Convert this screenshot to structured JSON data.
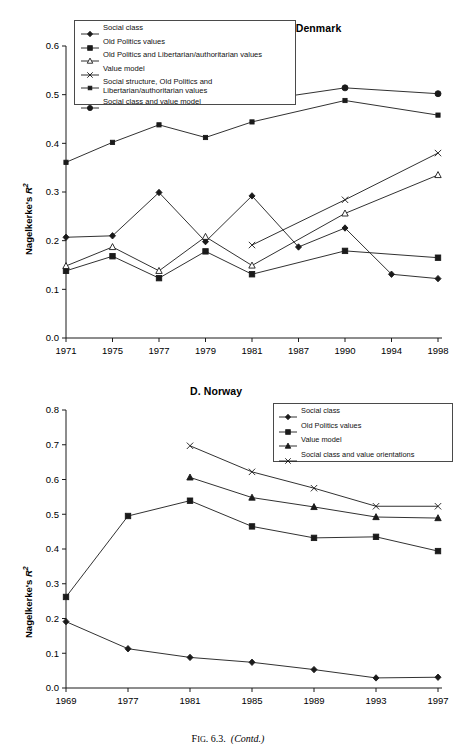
{
  "caption": {
    "fig_prefix": "F",
    "fig_small": "IG",
    "fig_number": ". 6.3.",
    "fig_contd": "(Contd.)"
  },
  "axis_label": {
    "y_text": "Nagelkerke's ",
    "y_italic": "R",
    "y_sup": "2"
  },
  "panels": [
    {
      "id": "denmark",
      "title": "C. Denmark",
      "legend": [
        {
          "label": "Social class",
          "marker": "diamond-filled"
        },
        {
          "label": "Old Politics values",
          "marker": "square-filled"
        },
        {
          "label": "Old Politics and Libertarian/authoritarian values",
          "marker": "triangle-open"
        },
        {
          "label": "Value model",
          "marker": "cross-x"
        },
        {
          "label": "Social structure, Old Politics and Libertarian/authoritarian values",
          "marker": "square-small-filled"
        },
        {
          "label": "Social class and value model",
          "marker": "circle-filled"
        }
      ]
    },
    {
      "id": "norway",
      "title": "D. Norway",
      "legend": [
        {
          "label": "Social class",
          "marker": "diamond-filled"
        },
        {
          "label": "Old Politics values",
          "marker": "square-filled"
        },
        {
          "label": "Value model",
          "marker": "triangle-filled"
        },
        {
          "label": "Social class and value orientations",
          "marker": "cross-x"
        }
      ]
    }
  ],
  "chart_data": [
    {
      "type": "line",
      "title": "C. Denmark",
      "xlabel": "",
      "ylabel": "Nagelkerke's R2",
      "categories": [
        "1971",
        "1975",
        "1977",
        "1979",
        "1981",
        "1987",
        "1990",
        "1994",
        "1998"
      ],
      "ylim": [
        0.0,
        0.6
      ],
      "yticks": [
        "0.0",
        "0.1",
        "0.2",
        "0.3",
        "0.4",
        "0.5",
        "0.6"
      ],
      "grid": false,
      "legend_position": "top-left",
      "series": [
        {
          "name": "Social class",
          "marker": "diamond-filled",
          "x": [
            "1971",
            "1975",
            "1977",
            "1979",
            "1981",
            "1987",
            "1990",
            "1994",
            "1998"
          ],
          "values": [
            0.207,
            0.21,
            0.299,
            0.198,
            0.292,
            0.187,
            0.226,
            0.131,
            0.122
          ]
        },
        {
          "name": "Old Politics values",
          "marker": "square-filled",
          "x": [
            "1971",
            "1975",
            "1977",
            "1979",
            "1981",
            "1987",
            "1990",
            "1994",
            "1998"
          ],
          "values": [
            0.138,
            0.168,
            0.123,
            0.178,
            0.131,
            null,
            0.179,
            null,
            0.165
          ]
        },
        {
          "name": "Old Politics and Libertarian/authoritarian values",
          "marker": "triangle-open",
          "x": [
            "1971",
            "1975",
            "1977",
            "1979",
            "1981",
            "1987",
            "1990",
            "1994",
            "1998"
          ],
          "values": [
            0.148,
            0.187,
            0.138,
            0.208,
            0.149,
            null,
            0.256,
            null,
            0.335
          ]
        },
        {
          "name": "Value model",
          "marker": "cross-x",
          "x": [
            "1981",
            "1990",
            "1998"
          ],
          "values": [
            0.191,
            0.284,
            0.38
          ]
        },
        {
          "name": "Social structure, Old Politics and Libertarian/authoritarian values",
          "marker": "square-small-filled",
          "x": [
            "1971",
            "1975",
            "1977",
            "1979",
            "1981",
            "1987",
            "1990",
            "1998"
          ],
          "values": [
            0.361,
            0.402,
            0.438,
            0.412,
            0.444,
            null,
            0.488,
            0.458
          ]
        },
        {
          "name": "Social class and value model",
          "marker": "circle-filled",
          "x": [
            "1981",
            "1990",
            "1998"
          ],
          "values": [
            0.486,
            0.514,
            0.502
          ]
        }
      ]
    },
    {
      "type": "line",
      "title": "D. Norway",
      "xlabel": "",
      "ylabel": "Nagelkerke's R2",
      "categories": [
        "1969",
        "1977",
        "1981",
        "1985",
        "1989",
        "1993",
        "1997"
      ],
      "ylim": [
        0.0,
        0.8
      ],
      "yticks": [
        "0.0",
        "0.1",
        "0.2",
        "0.3",
        "0.4",
        "0.5",
        "0.6",
        "0.7",
        "0.8"
      ],
      "grid": false,
      "legend_position": "top-right",
      "series": [
        {
          "name": "Social class",
          "marker": "diamond-filled",
          "x": [
            "1969",
            "1977",
            "1981",
            "1985",
            "1989",
            "1993",
            "1997"
          ],
          "values": [
            0.191,
            0.113,
            0.088,
            0.074,
            0.053,
            0.029,
            0.031
          ]
        },
        {
          "name": "Old Politics values",
          "marker": "square-filled",
          "x": [
            "1969",
            "1977",
            "1981",
            "1985",
            "1989",
            "1993",
            "1997"
          ],
          "values": [
            0.262,
            0.495,
            0.539,
            0.465,
            0.432,
            0.435,
            0.394
          ]
        },
        {
          "name": "Value model",
          "marker": "triangle-filled",
          "x": [
            "1981",
            "1985",
            "1989",
            "1993",
            "1997"
          ],
          "values": [
            0.606,
            0.548,
            0.521,
            0.492,
            0.489
          ]
        },
        {
          "name": "Social class and value orientations",
          "marker": "cross-x",
          "x": [
            "1981",
            "1985",
            "1989",
            "1993",
            "1997"
          ],
          "values": [
            0.697,
            0.622,
            0.575,
            0.523,
            0.523
          ]
        }
      ]
    }
  ]
}
